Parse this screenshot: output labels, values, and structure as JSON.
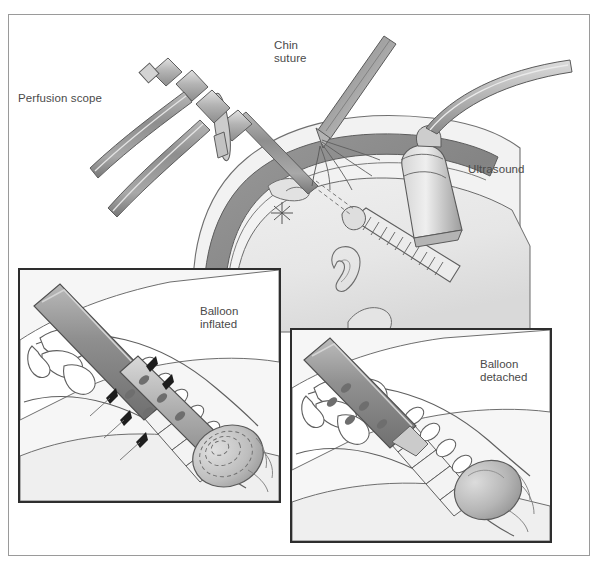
{
  "figure": {
    "background_color": "#ffffff",
    "frame_color": "#9a9a9a",
    "label_color": "#4a4a4a"
  },
  "labels": {
    "perfusion_scope": "Perfusion scope",
    "chin_suture": "Chin\nsuture",
    "ultrasound": "Ultrasound"
  },
  "insets": [
    {
      "id": "balloon-inflated",
      "label": "Balloon\ninflated",
      "border_color": "#2e2e2e"
    },
    {
      "id": "balloon-detached",
      "label": "Balloon\ndetached",
      "border_color": "#2e2e2e"
    }
  ],
  "palette": {
    "uterine_wall": "#8b8b8b",
    "amnion": "#d6d6d6",
    "fetal_tissue": "#eaeaea",
    "instrument_gray": "#9d9d9d",
    "instrument_light": "#cfcfcf",
    "outline": "#555555",
    "balloon_fill": "#bdbdbd",
    "tissue_light": "#f0f0f0"
  },
  "anatomy": {
    "structures": [
      "uterine wall",
      "amniotic cavity",
      "fetal head",
      "fetal ear",
      "fetal neck",
      "trachea with cartilage rings",
      "detachable balloon"
    ]
  },
  "instruments": {
    "items": [
      "perfusion fetoscope with side ports and tubing",
      "needle holder with chin suture",
      "ultrasound transducer probe with cable"
    ]
  }
}
